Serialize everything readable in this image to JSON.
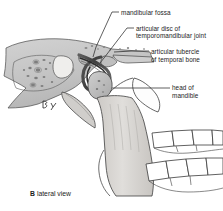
{
  "figure": {
    "type": "anatomical-illustration",
    "caption": {
      "letter": "B",
      "text": "lateral view"
    },
    "labels": [
      {
        "id": "mandibular-fossa",
        "text": "mandibular fossa",
        "lines": [
          "mandibular fossa"
        ],
        "leader_from": [
          119,
          12
        ],
        "leader_to": [
          95,
          57
        ]
      },
      {
        "id": "articular-disc",
        "text": "articular disc of temporomandibular joint",
        "lines": [
          "articular disc of",
          "temporomandibular joint"
        ],
        "leader_from": [
          134,
          28
        ],
        "leader_to": [
          101,
          62
        ]
      },
      {
        "id": "articular-tubercle",
        "text": "articular tubercle of temporal bone",
        "lines": [
          "articular tubercle",
          "of temporal bone"
        ],
        "leader_from": [
          149,
          51
        ],
        "leader_to": [
          112,
          51
        ]
      },
      {
        "id": "head-of-mandible",
        "text": "head of mandible",
        "lines": [
          "head of",
          "mandible"
        ],
        "leader_from": [
          170,
          88
        ],
        "leader_to": [
          110,
          88
        ]
      }
    ],
    "structures": [
      {
        "id": "temporal-bone",
        "name": "temporal bone",
        "fill": "#c9c9c9"
      },
      {
        "id": "mandibular-fossa-surface",
        "name": "mandibular fossa",
        "fill": "#bdbdbd"
      },
      {
        "id": "articular-disc-band",
        "name": "articular disc",
        "fill": "#5a5a5a"
      },
      {
        "id": "head-of-mandible-condyle",
        "name": "head of mandible",
        "fill": "#c4c4c4"
      },
      {
        "id": "ramus-of-mandible",
        "name": "ramus of mandible",
        "fill": "#d6d4d2"
      },
      {
        "id": "coronoid-process",
        "name": "coronoid process",
        "fill": "#ffffff"
      },
      {
        "id": "maxillary-molars",
        "name": "maxillary molars",
        "fill": "#ffffff"
      },
      {
        "id": "mandibular-molars",
        "name": "mandibular molars",
        "fill": "#ffffff"
      },
      {
        "id": "zygomatic-arch",
        "name": "zygomatic arch",
        "fill": "#cfcfcf"
      },
      {
        "id": "mastoid-air-cells",
        "name": "mastoid air cell stipple",
        "fill": "#b5b5b5"
      }
    ],
    "colors": {
      "ink": "#3a3a3a",
      "leader": "#2b2b2b",
      "bone_light": "#d9d7d4",
      "bone_mid": "#c6c6c6",
      "bone_dark": "#a8a8a8",
      "disc_dark": "#4f4f4f",
      "background": "#ffffff",
      "text": "#1c1c1c"
    }
  }
}
